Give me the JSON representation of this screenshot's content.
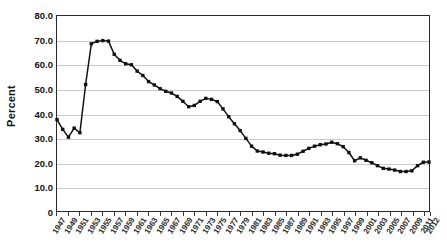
{
  "chart_data": {
    "type": "line",
    "title": "",
    "subtitle": "",
    "xlabel": "",
    "ylabel": "Percent",
    "ylim": [
      0,
      80
    ],
    "ytick_labels": [
      "80.0",
      "70.0",
      "60.0",
      "50.0",
      "40.0",
      "30.0",
      "20.0",
      "10.0",
      "0"
    ],
    "ytick_values": [
      80,
      70,
      60,
      50,
      40,
      30,
      20,
      10,
      0
    ],
    "xtick_labels": [
      "1947",
      "1949",
      "1951",
      "1953",
      "1955",
      "1957",
      "1959",
      "1961",
      "1963",
      "1965",
      "1967",
      "1969",
      "1971",
      "1973",
      "1975",
      "1977",
      "1979",
      "1981",
      "1983",
      "1985",
      "1987",
      "1989",
      "1991",
      "1993",
      "1995",
      "1997",
      "1999",
      "2001",
      "2003",
      "2005",
      "2007",
      "2009",
      "2011",
      "2012"
    ],
    "grid": "horizontal",
    "legend": "none",
    "marker": "filled-square",
    "line_color": "#111111",
    "marker_color": "#111111",
    "grid_color": "#c9c9c9",
    "axis_color": "#2a2a2a",
    "background_color": "#ffffff",
    "x": [
      1947,
      1948,
      1949,
      1950,
      1951,
      1952,
      1953,
      1954,
      1955,
      1956,
      1957,
      1958,
      1959,
      1960,
      1961,
      1962,
      1963,
      1964,
      1965,
      1966,
      1967,
      1968,
      1969,
      1970,
      1971,
      1972,
      1973,
      1974,
      1975,
      1976,
      1977,
      1978,
      1979,
      1980,
      1981,
      1982,
      1983,
      1984,
      1985,
      1986,
      1987,
      1988,
      1989,
      1990,
      1991,
      1992,
      1993,
      1994,
      1995,
      1996,
      1997,
      1998,
      1999,
      2000,
      2001,
      2002,
      2003,
      2004,
      2005,
      2006,
      2007,
      2008,
      2009,
      2010,
      2011,
      2012
    ],
    "values": [
      37.5,
      33.5,
      30.3,
      34.0,
      32.1,
      51.9,
      68.6,
      69.6,
      69.9,
      69.7,
      64.3,
      61.8,
      60.4,
      60.0,
      57.4,
      55.6,
      53.1,
      51.7,
      50.2,
      49.1,
      48.4,
      47.0,
      45.0,
      42.8,
      43.3,
      45.0,
      46.2,
      45.8,
      44.9,
      41.9,
      38.7,
      35.8,
      33.0,
      29.8,
      26.6,
      24.6,
      24.2,
      23.7,
      23.5,
      22.9,
      22.8,
      22.8,
      23.3,
      24.5,
      25.7,
      26.6,
      27.2,
      27.5,
      28.2,
      27.6,
      26.4,
      24.0,
      20.6,
      21.8,
      20.8,
      19.8,
      18.6,
      17.5,
      17.2,
      16.8,
      16.2,
      16.2,
      16.5,
      18.6,
      20.0,
      20.1
    ]
  },
  "axes": {
    "y_title": "Percent"
  }
}
